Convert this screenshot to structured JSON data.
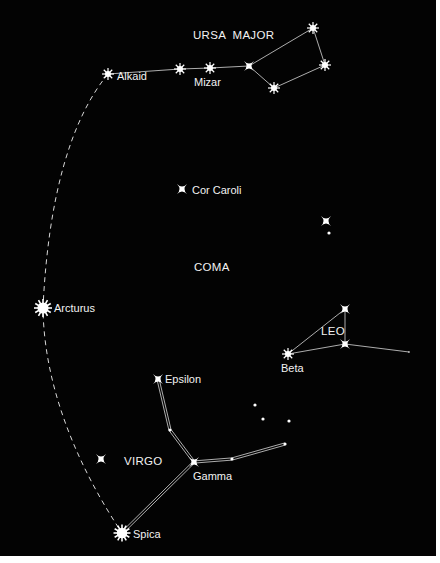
{
  "colors": {
    "background": "#030303",
    "star": "#ffffff",
    "line": "#d8d8d8",
    "text": "#f2f2f2",
    "border": "#ffffff"
  },
  "constellations": [
    {
      "id": "ursa-major",
      "label": "URSA  MAJOR"
    },
    {
      "id": "coma",
      "label": "COMA"
    },
    {
      "id": "leo",
      "label": "LEO"
    },
    {
      "id": "virgo",
      "label": "VIRGO"
    }
  ],
  "stars": {
    "dubhe": {
      "name": "",
      "type": "burst8",
      "mag": 2
    },
    "merak": {
      "name": "",
      "type": "burst8",
      "mag": 2
    },
    "phecda": {
      "name": "",
      "type": "burst8",
      "mag": 2
    },
    "megrez": {
      "name": "",
      "type": "cross4",
      "mag": 3
    },
    "alioth": {
      "name": "",
      "type": "burst8",
      "mag": 2
    },
    "mizar": {
      "name": "Mizar",
      "type": "burst8",
      "mag": 2
    },
    "alkaid": {
      "name": "Alkaid",
      "type": "burst8",
      "mag": 2
    },
    "cor_caroli": {
      "name": "Cor Caroli",
      "type": "cross4",
      "mag": 3
    },
    "coma_star": {
      "name": "",
      "type": "cross4",
      "mag": 3
    },
    "coma_dot": {
      "name": "",
      "type": "dot",
      "mag": 5
    },
    "arcturus": {
      "name": "Arcturus",
      "type": "sun",
      "mag": 0
    },
    "leo_top": {
      "name": "",
      "type": "cross4",
      "mag": 3
    },
    "leo_mid": {
      "name": "",
      "type": "cross4",
      "mag": 3
    },
    "leo_end": {
      "name": "",
      "type": "dot",
      "mag": 6
    },
    "beta_leo": {
      "name": "Beta",
      "type": "burst8",
      "mag": 2
    },
    "epsilon_vir": {
      "name": "Epsilon",
      "type": "cross4",
      "mag": 3
    },
    "virgo_mid": {
      "name": "",
      "type": "dot",
      "mag": 4
    },
    "gamma_vir": {
      "name": "Gamma",
      "type": "cross4",
      "mag": 3
    },
    "virgo_r1": {
      "name": "",
      "type": "dot",
      "mag": 4
    },
    "virgo_r2": {
      "name": "",
      "type": "dot",
      "mag": 4
    },
    "virgo_lone": {
      "name": "",
      "type": "cross4",
      "mag": 3
    },
    "spica": {
      "name": "Spica",
      "type": "sun",
      "mag": 1
    },
    "faint1": {
      "name": "",
      "type": "dot",
      "mag": 5
    },
    "faint2": {
      "name": "",
      "type": "dot",
      "mag": 5
    },
    "faint3": {
      "name": "",
      "type": "dot",
      "mag": 5
    }
  },
  "lines": {
    "ursa_major": [
      [
        "alkaid",
        "mizar"
      ],
      [
        "mizar",
        "alioth"
      ],
      [
        "alioth",
        "megrez"
      ],
      [
        "megrez",
        "dubhe"
      ],
      [
        "dubhe",
        "merak"
      ],
      [
        "merak",
        "phecda"
      ],
      [
        "phecda",
        "megrez"
      ]
    ],
    "leo": [
      [
        "beta_leo",
        "leo_top"
      ],
      [
        "leo_top",
        "leo_mid"
      ],
      [
        "beta_leo",
        "leo_mid"
      ],
      [
        "leo_mid",
        "leo_end"
      ]
    ],
    "virgo": [
      [
        "epsilon_vir",
        "virgo_mid"
      ],
      [
        "virgo_mid",
        "gamma_vir"
      ],
      [
        "gamma_vir",
        "virgo_r1"
      ],
      [
        "virgo_r1",
        "virgo_r2"
      ],
      [
        "gamma_vir",
        "spica"
      ]
    ]
  },
  "arc": {
    "style": "dashed",
    "through": [
      "alkaid",
      "arcturus",
      "spica"
    ],
    "description": "Arc to Arcturus, speed on to Spica"
  }
}
